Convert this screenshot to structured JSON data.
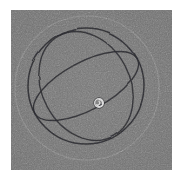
{
  "figure": {
    "title": "",
    "caption": "",
    "panel_background_color": "#717171",
    "page_background_color": "#ffffff",
    "panel": {
      "x": 11,
      "y": 10,
      "width": 161,
      "height": 160
    }
  },
  "chart_data": {
    "type": "diagram",
    "subtype": "sphere-great-circles",
    "title": "",
    "subtitle": "",
    "xlabel": "",
    "ylabel": "",
    "grid": false,
    "legend": null,
    "axis_ticks": [],
    "tick_labels": [],
    "annotations": [],
    "colors": {
      "background": "#717171",
      "dark_stroke": "#26262a",
      "mid_stroke": "#3a3a3e",
      "faint_stroke": "#8e8e8e",
      "marker_stroke": "#d8d8d8"
    },
    "center": {
      "x": 76,
      "y": 78
    },
    "elements": [
      {
        "name": "outer-faint-circle",
        "shape": "circle",
        "cx": 76,
        "cy": 78,
        "r": 72,
        "stroke": "#8e8e8e",
        "stroke_width": 1.1,
        "rotation": 0,
        "opacity": 0.55
      },
      {
        "name": "sphere-outline-circle",
        "shape": "circle",
        "cx": 75,
        "cy": 76,
        "r": 58,
        "stroke": "#26262a",
        "stroke_width": 1.5,
        "rotation": 0,
        "opacity": 0.92
      },
      {
        "name": "great-circle-ellipse-a",
        "shape": "ellipse",
        "cx": 75,
        "cy": 76,
        "rx": 58,
        "ry": 24,
        "rotation": -28,
        "stroke": "#26262a",
        "stroke_width": 1.4,
        "opacity": 0.9
      },
      {
        "name": "great-circle-ellipse-b",
        "shape": "ellipse",
        "cx": 75,
        "cy": 76,
        "rx": 57,
        "ry": 44,
        "rotation": 62,
        "stroke": "#26262a",
        "stroke_width": 1.4,
        "opacity": 0.88
      },
      {
        "name": "center-spiral-marker",
        "shape": "spiral",
        "cx": 88,
        "cy": 93,
        "r": 5,
        "stroke": "#d8d8d8",
        "stroke_width": 1.4,
        "rotation": 0,
        "opacity": 1
      }
    ]
  }
}
